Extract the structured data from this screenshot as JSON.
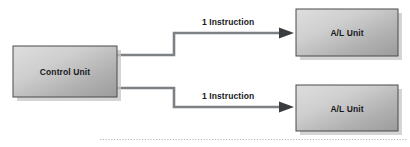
{
  "diagram": {
    "background_color": "#ffffff",
    "nodes": [
      {
        "id": "control-unit",
        "label": "Control Unit",
        "shape": "rectangle",
        "x": 13,
        "y": 46,
        "width": 104,
        "height": 51,
        "fill_light": "#d8d8d8",
        "fill_dark": "#9a9a9a",
        "border_color": "#4b4b4b",
        "shadow_color": "#bfbfbf"
      },
      {
        "id": "alu-top",
        "label": "A/L Unit",
        "shape": "rectangle",
        "x": 296,
        "y": 9,
        "width": 102,
        "height": 47,
        "fill_light": "#d8d8d8",
        "fill_dark": "#9a9a9a",
        "border_color": "#4b4b4b",
        "shadow_color": "#bfbfbf"
      },
      {
        "id": "alu-bottom",
        "label": "A/L Unit",
        "shape": "rectangle",
        "x": 296,
        "y": 85,
        "width": 102,
        "height": 46,
        "fill_light": "#d8d8d8",
        "fill_dark": "#9a9a9a",
        "border_color": "#4b4b4b",
        "shadow_color": "#bfbfbf"
      }
    ],
    "edges": [
      {
        "id": "edge-top",
        "from": "control-unit",
        "to": "alu-top",
        "label": "1 Instruction",
        "arrowhead": "filled-triangle",
        "color": "#6f7276",
        "arrow_color": "#3b3d40",
        "route": "step-up"
      },
      {
        "id": "edge-bottom",
        "from": "control-unit",
        "to": "alu-bottom",
        "label": "1 Instruction",
        "arrowhead": "filled-triangle",
        "color": "#6f7276",
        "arrow_color": "#3b3d40",
        "route": "step-down"
      }
    ],
    "footer_rule": {
      "id": "bottom-dotted-rule",
      "style": "dotted",
      "color": "#b4b4b4"
    }
  }
}
